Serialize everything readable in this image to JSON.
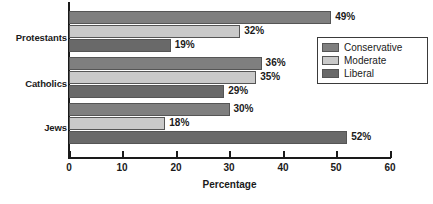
{
  "chart_data": {
    "type": "bar",
    "orientation": "horizontal",
    "title": "",
    "xlabel": "Percentage",
    "ylabel": "",
    "xlim": [
      0,
      60
    ],
    "xticks": [
      0,
      10,
      20,
      30,
      40,
      50,
      60
    ],
    "xtick_labels": [
      "0",
      "10",
      "20",
      "30",
      "40",
      "50",
      "60"
    ],
    "grid": false,
    "legend_position": "right-upper",
    "categories": [
      "Protestants",
      "Catholics",
      "Jews"
    ],
    "series": [
      {
        "name": "Conservative",
        "color": "#7f7f7f",
        "values": [
          49,
          36,
          30
        ],
        "value_labels": [
          "49%",
          "36%",
          "30%"
        ]
      },
      {
        "name": "Moderate",
        "color": "#c9c9c9",
        "values": [
          32,
          35,
          18
        ],
        "value_labels": [
          "32%",
          "35%",
          "18%"
        ]
      },
      {
        "name": "Liberal",
        "color": "#696969",
        "values": [
          19,
          29,
          52
        ],
        "value_labels": [
          "19%",
          "29%",
          "52%"
        ]
      }
    ]
  },
  "legend": {
    "items": [
      {
        "label": "Conservative",
        "color": "#7f7f7f"
      },
      {
        "label": "Moderate",
        "color": "#c9c9c9"
      },
      {
        "label": "Liberal",
        "color": "#696969"
      }
    ]
  },
  "axis": {
    "x_title": "Percentage"
  },
  "colors": {
    "conservative": "#7f7f7f",
    "moderate": "#c9c9c9",
    "liberal": "#696969",
    "axis": "#1a1a1a",
    "background": "#ffffff"
  }
}
